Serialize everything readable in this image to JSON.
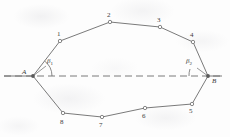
{
  "figure": {
    "stroke_color": "#6b6b6b",
    "label_color": "#3a3a3a",
    "background_color": "#fdfdfd",
    "width": 230,
    "height": 137,
    "reference_line": {
      "name": "horizontal-reference-line",
      "style": "dashed",
      "y": 76,
      "x_start": 4,
      "x_end": 222
    },
    "endpoints": [
      {
        "id": "A",
        "label": "A",
        "x": 33,
        "y": 76,
        "label_x": 22,
        "label_y": 69
      },
      {
        "id": "B",
        "label": "B",
        "x": 208,
        "y": 76,
        "label_x": 212,
        "label_y": 78
      }
    ],
    "angles": [
      {
        "id": "beta1",
        "base": "β",
        "sub": "1",
        "x": 47,
        "y": 58,
        "at": "A"
      },
      {
        "id": "beta2",
        "base": "β",
        "sub": "2",
        "x": 186,
        "y": 58,
        "at": "B"
      }
    ],
    "vertices": [
      {
        "id": "1",
        "label": "1",
        "x": 60,
        "y": 41,
        "label_x": 57,
        "label_y": 31
      },
      {
        "id": "2",
        "label": "2",
        "x": 110,
        "y": 22,
        "label_x": 107,
        "label_y": 12
      },
      {
        "id": "3",
        "label": "3",
        "x": 160,
        "y": 27,
        "label_x": 157,
        "label_y": 17
      },
      {
        "id": "4",
        "label": "4",
        "x": 193,
        "y": 42,
        "label_x": 190,
        "label_y": 32
      },
      {
        "id": "5",
        "label": "5",
        "x": 192,
        "y": 104,
        "label_x": 189,
        "label_y": 108
      },
      {
        "id": "6",
        "label": "6",
        "x": 145,
        "y": 108,
        "label_x": 142,
        "label_y": 113
      },
      {
        "id": "7",
        "label": "7",
        "x": 102,
        "y": 117,
        "label_x": 99,
        "label_y": 122
      },
      {
        "id": "8",
        "label": "8",
        "x": 63,
        "y": 113,
        "label_x": 60,
        "label_y": 119
      }
    ],
    "edges": [
      {
        "from": "A",
        "to": "1"
      },
      {
        "from": "1",
        "to": "2"
      },
      {
        "from": "2",
        "to": "3"
      },
      {
        "from": "3",
        "to": "4"
      },
      {
        "from": "4",
        "to": "B"
      },
      {
        "from": "B",
        "to": "5"
      },
      {
        "from": "5",
        "to": "6"
      },
      {
        "from": "6",
        "to": "7"
      },
      {
        "from": "7",
        "to": "8"
      },
      {
        "from": "8",
        "to": "A"
      }
    ]
  }
}
